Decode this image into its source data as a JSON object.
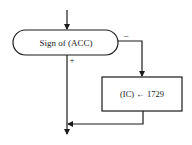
{
  "diagram": {
    "type": "flowchart",
    "decision": {
      "label": "Sign of (ACC)"
    },
    "process": {
      "label": "(IC) ← 1729"
    },
    "branches": {
      "negative": "−",
      "positive": "+"
    },
    "colors": {
      "stroke": "#1a1a1a",
      "background": "#ffffff"
    }
  }
}
